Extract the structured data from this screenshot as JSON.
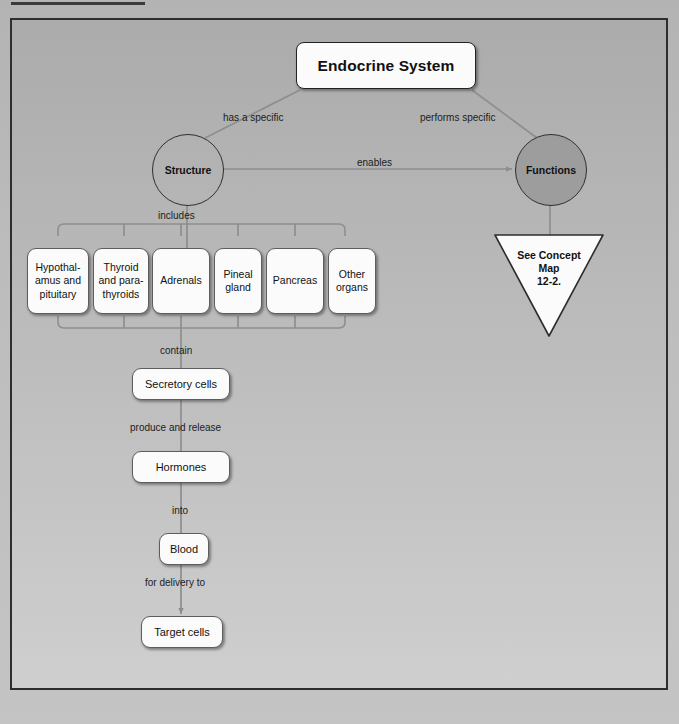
{
  "page": {
    "background_color": "#b9b9b9",
    "panel_border_color": "#2e2e2e"
  },
  "diagram": {
    "title": "Endocrine System",
    "nodes": {
      "structure": "Structure",
      "functions": "Functions",
      "secretory_cells": "Secretory cells",
      "hormones": "Hormones",
      "blood": "Blood",
      "target_cells": "Target cells"
    },
    "organs": [
      {
        "label": "Hypothal-\namus and\npituitary",
        "left": 15,
        "width": 62
      },
      {
        "label": "Thyroid\nand para-\nthyroids",
        "left": 81,
        "width": 56
      },
      {
        "label": "Adrenals",
        "left": 140,
        "width": 58
      },
      {
        "label": "Pineal\ngland",
        "left": 202,
        "width": 48
      },
      {
        "label": "Pancreas",
        "left": 254,
        "width": 58
      },
      {
        "label": "Other\norgans",
        "left": 316,
        "width": 48
      }
    ],
    "edge_labels": {
      "has_a_specific": "has a specific",
      "performs_specific": "performs specific",
      "enables": "enables",
      "includes": "includes",
      "contain": "contain",
      "produce_and_release": "produce and release",
      "into": "into",
      "for_delivery_to": "for delivery to"
    },
    "callout": {
      "text": "See Concept\nMap\n12-2.",
      "shape": "downward-triangle"
    },
    "colors": {
      "node_fill": "#fbfbfb",
      "functions_fill": "#9d9d9d",
      "connector": "#8e8e8e",
      "outline": "#5d5d5d"
    }
  }
}
